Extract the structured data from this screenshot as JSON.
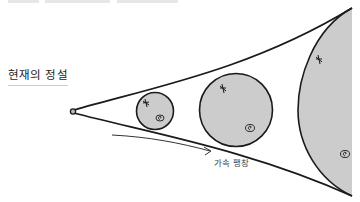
{
  "title": "현재의 정설",
  "diagram": {
    "expansion_label": "가속 팽창",
    "colors": {
      "stroke": "#1a1a1a",
      "fill": "#cccccc",
      "background": "#ffffff"
    },
    "icons": [
      "star-icon",
      "spiral-galaxy-icon"
    ]
  }
}
